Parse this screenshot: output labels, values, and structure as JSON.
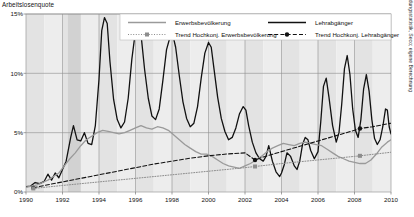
{
  "chart_title": "Arbeitslosenquote",
  "source_note": "Quelle: AMM, Bildungsstatistik, Seco; eigene Berechnung",
  "legend": {
    "items": [
      {
        "label": "Erwerbsbevölkerung",
        "style": "solid-gray",
        "color": "#9a9a9a"
      },
      {
        "label": "Lehrabgänger",
        "style": "solid-black",
        "color": "#111111"
      },
      {
        "label": "Trend Hochkonj. Erwerbsbevölkerung",
        "style": "dotted-marker-gray",
        "color": "#8c8c8c"
      },
      {
        "label": "Trend Hochkonj. Lehrabgänger",
        "style": "dashed-marker-black",
        "color": "#111111"
      }
    ]
  },
  "chart_data": {
    "type": "line",
    "title": "Arbeitslosenquote",
    "xlabel": "",
    "ylabel": "Arbeitslosenquote",
    "xlim": [
      1990,
      2010
    ],
    "ylim": [
      0,
      15
    ],
    "grid": true,
    "legend_position": "top",
    "ytick_labels": [
      "0%",
      "5%",
      "10%",
      "15%"
    ],
    "ytick_values": [
      0,
      5,
      10,
      15
    ],
    "xtick_labels": [
      "1990",
      "1992",
      "1994",
      "1996",
      "1998",
      "2000",
      "2002",
      "2004",
      "2006",
      "2008",
      "2010"
    ],
    "xtick_values": [
      1990,
      1992,
      1994,
      1996,
      1998,
      2000,
      2002,
      2004,
      2006,
      2008,
      2010
    ],
    "series": [
      {
        "name": "Lehrabgänger",
        "color": "#111111",
        "style": "solid",
        "width": 1.3,
        "points": [
          [
            1990.0,
            0.45
          ],
          [
            1990.25,
            0.5
          ],
          [
            1990.5,
            0.8
          ],
          [
            1990.75,
            0.7
          ],
          [
            1991.0,
            0.9
          ],
          [
            1991.2,
            1.5
          ],
          [
            1991.4,
            1.0
          ],
          [
            1991.6,
            1.6
          ],
          [
            1991.8,
            1.2
          ],
          [
            1992.0,
            1.9
          ],
          [
            1992.2,
            2.6
          ],
          [
            1992.45,
            4.6
          ],
          [
            1992.6,
            5.6
          ],
          [
            1992.8,
            4.4
          ],
          [
            1993.0,
            4.3
          ],
          [
            1993.2,
            5.0
          ],
          [
            1993.4,
            4.1
          ],
          [
            1993.6,
            4.0
          ],
          [
            1993.8,
            5.6
          ],
          [
            1994.0,
            9.5
          ],
          [
            1994.15,
            13.6
          ],
          [
            1994.3,
            14.7
          ],
          [
            1994.45,
            14.2
          ],
          [
            1994.6,
            11.0
          ],
          [
            1994.8,
            7.8
          ],
          [
            1995.0,
            6.1
          ],
          [
            1995.2,
            5.4
          ],
          [
            1995.4,
            5.9
          ],
          [
            1995.6,
            7.9
          ],
          [
            1995.8,
            11.2
          ],
          [
            1996.0,
            13.6
          ],
          [
            1996.15,
            14.6
          ],
          [
            1996.3,
            13.3
          ],
          [
            1996.5,
            10.3
          ],
          [
            1996.7,
            7.9
          ],
          [
            1996.9,
            6.4
          ],
          [
            1997.1,
            6.1
          ],
          [
            1997.3,
            7.0
          ],
          [
            1997.5,
            9.4
          ],
          [
            1997.7,
            12.0
          ],
          [
            1997.9,
            13.1
          ],
          [
            1998.05,
            13.2
          ],
          [
            1998.2,
            12.2
          ],
          [
            1998.4,
            9.8
          ],
          [
            1998.6,
            7.6
          ],
          [
            1998.8,
            6.2
          ],
          [
            1999.0,
            5.5
          ],
          [
            1999.2,
            5.8
          ],
          [
            1999.4,
            7.2
          ],
          [
            1999.6,
            9.6
          ],
          [
            1999.8,
            11.7
          ],
          [
            2000.0,
            12.6
          ],
          [
            2000.15,
            12.2
          ],
          [
            2000.3,
            10.4
          ],
          [
            2000.5,
            8.0
          ],
          [
            2000.7,
            6.2
          ],
          [
            2000.9,
            5.1
          ],
          [
            2001.1,
            4.4
          ],
          [
            2001.3,
            4.6
          ],
          [
            2001.5,
            5.4
          ],
          [
            2001.7,
            6.6
          ],
          [
            2001.9,
            7.2
          ],
          [
            2002.05,
            6.9
          ],
          [
            2002.2,
            5.6
          ],
          [
            2002.4,
            4.2
          ],
          [
            2002.6,
            3.3
          ],
          [
            2002.8,
            2.8
          ],
          [
            2003.0,
            2.6
          ],
          [
            2003.15,
            3.0
          ],
          [
            2003.3,
            3.9
          ],
          [
            2003.5,
            2.6
          ],
          [
            2003.7,
            1.7
          ],
          [
            2003.9,
            1.3
          ],
          [
            2004.0,
            1.6
          ],
          [
            2004.15,
            2.3
          ],
          [
            2004.3,
            3.3
          ],
          [
            2004.5,
            3.0
          ],
          [
            2004.7,
            2.2
          ],
          [
            2004.85,
            1.9
          ],
          [
            2005.0,
            2.6
          ],
          [
            2005.15,
            4.0
          ],
          [
            2005.3,
            4.6
          ],
          [
            2005.45,
            4.4
          ],
          [
            2005.6,
            3.5
          ],
          [
            2005.8,
            2.8
          ],
          [
            2006.0,
            3.4
          ],
          [
            2006.15,
            5.9
          ],
          [
            2006.3,
            8.9
          ],
          [
            2006.45,
            9.6
          ],
          [
            2006.6,
            8.0
          ],
          [
            2006.8,
            5.6
          ],
          [
            2007.0,
            4.2
          ],
          [
            2007.15,
            5.0
          ],
          [
            2007.3,
            7.4
          ],
          [
            2007.45,
            10.4
          ],
          [
            2007.6,
            11.5
          ],
          [
            2007.75,
            9.9
          ],
          [
            2007.9,
            7.0
          ],
          [
            2008.05,
            5.2
          ],
          [
            2008.2,
            4.6
          ],
          [
            2008.35,
            6.1
          ],
          [
            2008.5,
            8.7
          ],
          [
            2008.65,
            9.9
          ],
          [
            2008.8,
            8.5
          ],
          [
            2008.95,
            6.1
          ],
          [
            2009.1,
            4.5
          ],
          [
            2009.25,
            4.0
          ],
          [
            2009.4,
            4.4
          ],
          [
            2009.55,
            5.5
          ],
          [
            2009.7,
            7.0
          ],
          [
            2009.8,
            6.9
          ],
          [
            2009.9,
            5.5
          ],
          [
            2010.0,
            4.9
          ]
        ]
      },
      {
        "name": "Erwerbsbevölkerung",
        "color": "#9a9a9a",
        "style": "solid",
        "width": 1.3,
        "points": [
          [
            1990.0,
            0.4
          ],
          [
            1990.3,
            0.5
          ],
          [
            1990.6,
            0.6
          ],
          [
            1990.9,
            0.8
          ],
          [
            1991.2,
            1.0
          ],
          [
            1991.5,
            1.3
          ],
          [
            1991.8,
            1.6
          ],
          [
            1992.1,
            2.2
          ],
          [
            1992.4,
            2.8
          ],
          [
            1992.7,
            3.3
          ],
          [
            1993.0,
            3.9
          ],
          [
            1993.3,
            4.4
          ],
          [
            1993.6,
            4.7
          ],
          [
            1993.9,
            5.0
          ],
          [
            1994.2,
            5.2
          ],
          [
            1994.5,
            5.1
          ],
          [
            1994.8,
            5.0
          ],
          [
            1995.1,
            4.9
          ],
          [
            1995.4,
            5.0
          ],
          [
            1995.7,
            5.2
          ],
          [
            1996.0,
            5.4
          ],
          [
            1996.3,
            5.6
          ],
          [
            1996.6,
            5.4
          ],
          [
            1996.9,
            5.3
          ],
          [
            1997.2,
            5.5
          ],
          [
            1997.5,
            5.4
          ],
          [
            1997.8,
            5.2
          ],
          [
            1998.1,
            4.8
          ],
          [
            1998.4,
            4.4
          ],
          [
            1998.7,
            4.0
          ],
          [
            1999.0,
            3.7
          ],
          [
            1999.3,
            3.4
          ],
          [
            1999.6,
            3.2
          ],
          [
            1999.9,
            3.2
          ],
          [
            2000.2,
            3.0
          ],
          [
            2000.5,
            2.7
          ],
          [
            2000.8,
            2.4
          ],
          [
            2001.1,
            2.2
          ],
          [
            2001.4,
            2.1
          ],
          [
            2001.7,
            2.0
          ],
          [
            2002.0,
            2.2
          ],
          [
            2002.3,
            2.4
          ],
          [
            2002.6,
            2.7
          ],
          [
            2002.9,
            3.0
          ],
          [
            2003.2,
            3.4
          ],
          [
            2003.5,
            3.7
          ],
          [
            2003.8,
            3.9
          ],
          [
            2004.1,
            4.1
          ],
          [
            2004.4,
            4.0
          ],
          [
            2004.7,
            3.9
          ],
          [
            2005.0,
            4.1
          ],
          [
            2005.3,
            4.2
          ],
          [
            2005.6,
            4.1
          ],
          [
            2005.9,
            4.0
          ],
          [
            2006.2,
            3.9
          ],
          [
            2006.5,
            3.6
          ],
          [
            2006.8,
            3.3
          ],
          [
            2007.1,
            3.0
          ],
          [
            2007.4,
            2.8
          ],
          [
            2007.7,
            2.6
          ],
          [
            2008.0,
            2.5
          ],
          [
            2008.3,
            2.4
          ],
          [
            2008.6,
            2.4
          ],
          [
            2008.9,
            2.7
          ],
          [
            2009.2,
            3.2
          ],
          [
            2009.5,
            3.8
          ],
          [
            2009.8,
            4.2
          ],
          [
            2010.0,
            4.4
          ]
        ]
      },
      {
        "name": "Trend Hochkonj. Lehrabgänger",
        "color": "#111111",
        "style": "dashed",
        "width": 1.1,
        "markers": true,
        "points": [
          [
            1990.4,
            0.35
          ],
          [
            1991.0,
            0.55
          ],
          [
            1992.0,
            0.85
          ],
          [
            1993.0,
            1.15
          ],
          [
            1994.0,
            1.45
          ],
          [
            1995.0,
            1.75
          ],
          [
            1996.0,
            2.05
          ],
          [
            1997.0,
            2.35
          ],
          [
            1998.0,
            2.6
          ],
          [
            1999.0,
            2.85
          ],
          [
            2000.0,
            3.05
          ],
          [
            2001.0,
            3.2
          ],
          [
            2002.0,
            3.3
          ],
          [
            2002.55,
            2.7
          ],
          [
            2003.0,
            2.95
          ],
          [
            2004.0,
            3.4
          ],
          [
            2005.0,
            3.85
          ],
          [
            2006.0,
            4.3
          ],
          [
            2007.0,
            4.75
          ],
          [
            2008.0,
            5.2
          ],
          [
            2008.3,
            5.35
          ],
          [
            2009.0,
            5.5
          ],
          [
            2010.0,
            5.8
          ]
        ],
        "marker_points": [
          [
            1990.4,
            0.35
          ],
          [
            2002.55,
            2.7
          ],
          [
            2008.3,
            5.35
          ]
        ]
      },
      {
        "name": "Trend Hochkonj. Erwerbsbevölkerung",
        "color": "#8c8c8c",
        "style": "dotted",
        "width": 1.0,
        "markers": true,
        "points": [
          [
            1990.4,
            0.3
          ],
          [
            1992.0,
            0.55
          ],
          [
            1994.0,
            0.85
          ],
          [
            1996.0,
            1.15
          ],
          [
            1998.0,
            1.45
          ],
          [
            2000.0,
            1.75
          ],
          [
            2002.0,
            2.05
          ],
          [
            2002.55,
            2.15
          ],
          [
            2004.0,
            2.4
          ],
          [
            2006.0,
            2.7
          ],
          [
            2008.0,
            3.0
          ],
          [
            2008.3,
            3.05
          ],
          [
            2010.0,
            3.35
          ]
        ],
        "marker_points": [
          [
            1990.4,
            0.3
          ],
          [
            2002.55,
            2.15
          ],
          [
            2008.3,
            3.05
          ]
        ]
      }
    ]
  }
}
